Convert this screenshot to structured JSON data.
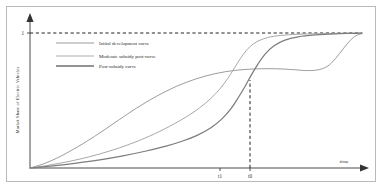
{
  "chart_data": {
    "type": "line",
    "title": "",
    "xlabel": "time",
    "ylabel": "Market Share of Electric Vehicles",
    "xlim": [
      0,
      1
    ],
    "ylim": [
      0,
      1.06
    ],
    "grid": false,
    "legend_position": "upper-left",
    "y_ticks": [
      {
        "label": "1",
        "value": 1
      }
    ],
    "x_ticks": [
      {
        "label": "t1",
        "value": 0.568
      },
      {
        "label": "t0",
        "value": 0.663
      }
    ],
    "annotations": [
      {
        "name": "saturation-line",
        "type": "dashed-horizontal",
        "y": 1
      },
      {
        "name": "t0-marker",
        "type": "dashed-vertical",
        "x": 0.663
      }
    ],
    "series": [
      {
        "name": "Initial development curve",
        "color": "#8a8a8a",
        "width": 0.85,
        "points": [
          [
            0.0,
            0.0
          ],
          [
            0.04,
            0.03
          ],
          [
            0.08,
            0.072
          ],
          [
            0.12,
            0.124
          ],
          [
            0.17,
            0.196
          ],
          [
            0.22,
            0.276
          ],
          [
            0.27,
            0.36
          ],
          [
            0.32,
            0.442
          ],
          [
            0.38,
            0.53
          ],
          [
            0.44,
            0.604
          ],
          [
            0.5,
            0.66
          ],
          [
            0.56,
            0.7
          ],
          [
            0.62,
            0.724
          ],
          [
            0.68,
            0.734
          ],
          [
            0.74,
            0.735
          ],
          [
            0.79,
            0.729
          ],
          [
            0.83,
            0.722
          ],
          [
            0.865,
            0.726
          ],
          [
            0.895,
            0.752
          ],
          [
            0.92,
            0.81
          ],
          [
            0.945,
            0.888
          ],
          [
            0.965,
            0.946
          ],
          [
            0.982,
            0.98
          ],
          [
            1.0,
            0.996
          ]
        ]
      },
      {
        "name": "Moderate subsidy post-curve",
        "color": "#a8a8a8",
        "width": 1.0,
        "points": [
          [
            0.0,
            0.0
          ],
          [
            0.06,
            0.022
          ],
          [
            0.12,
            0.05
          ],
          [
            0.18,
            0.084
          ],
          [
            0.24,
            0.126
          ],
          [
            0.3,
            0.176
          ],
          [
            0.36,
            0.236
          ],
          [
            0.42,
            0.308
          ],
          [
            0.47,
            0.378
          ],
          [
            0.51,
            0.444
          ],
          [
            0.545,
            0.516
          ],
          [
            0.572,
            0.586
          ],
          [
            0.596,
            0.664
          ],
          [
            0.616,
            0.742
          ],
          [
            0.634,
            0.812
          ],
          [
            0.652,
            0.872
          ],
          [
            0.672,
            0.918
          ],
          [
            0.696,
            0.95
          ],
          [
            0.726,
            0.972
          ],
          [
            0.765,
            0.984
          ],
          [
            0.82,
            0.992
          ],
          [
            0.89,
            0.996
          ],
          [
            0.95,
            0.998
          ],
          [
            1.0,
            0.999
          ]
        ]
      },
      {
        "name": "Post-subsidy curve",
        "color": "#7d7d7d",
        "width": 1.25,
        "points": [
          [
            0.0,
            0.0
          ],
          [
            0.07,
            0.016
          ],
          [
            0.14,
            0.036
          ],
          [
            0.21,
            0.06
          ],
          [
            0.28,
            0.09
          ],
          [
            0.35,
            0.126
          ],
          [
            0.41,
            0.162
          ],
          [
            0.46,
            0.2
          ],
          [
            0.505,
            0.244
          ],
          [
            0.545,
            0.298
          ],
          [
            0.578,
            0.364
          ],
          [
            0.606,
            0.442
          ],
          [
            0.628,
            0.524
          ],
          [
            0.648,
            0.606
          ],
          [
            0.666,
            0.686
          ],
          [
            0.686,
            0.768
          ],
          [
            0.708,
            0.844
          ],
          [
            0.734,
            0.904
          ],
          [
            0.766,
            0.946
          ],
          [
            0.808,
            0.972
          ],
          [
            0.862,
            0.986
          ],
          [
            0.92,
            0.994
          ],
          [
            0.965,
            0.997
          ],
          [
            1.0,
            0.999
          ]
        ]
      }
    ]
  },
  "legend": {
    "items": [
      {
        "label": "Initial development curve",
        "color": "#8a8a8a",
        "width": 0.85
      },
      {
        "label": "Moderate subsidy post-curve",
        "color": "#b0b0b0",
        "width": 1.1
      },
      {
        "label": "Post-subsidy curve",
        "color": "#6f6f6f",
        "width": 1.5
      }
    ]
  },
  "axes": {
    "x_title": "time",
    "y_title": "Market Share of Electric Vehicles",
    "y_tick_1": "1",
    "x_tick_t1": "t1",
    "x_tick_t0": "t0"
  }
}
